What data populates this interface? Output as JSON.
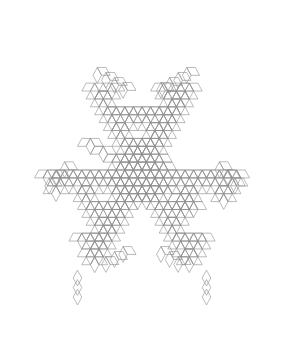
{
  "figure": {
    "title": "Rhombus Fractal Snowflake",
    "type": "geometric-line-drawing",
    "canvas": {
      "width": 284,
      "height": 339,
      "background_color": "#ffffff"
    },
    "stroke": {
      "color": "#8d8d8d",
      "width": 0.6,
      "fill": "none"
    },
    "geometry": {
      "tile_shape": "rhombus",
      "tile_angle_degrees": 60,
      "edge_length": 8.6,
      "symmetry": "6-fold dihedral (D6), vertically elongated",
      "center_x": 142,
      "center_y": 170,
      "aspect_scale_x": 1.0,
      "aspect_scale_y": 1.06,
      "bounds": {
        "left": 18,
        "right": 266,
        "top": 12,
        "bottom": 322
      }
    },
    "construction": {
      "description": "Fractal aggregate of 60-degree rhombi grown on a triangular lattice. Each lattice node within the generator mask emits three rhombi at 0, 60 and 120 degrees.",
      "levels": 3,
      "branch_directions_degrees": [
        0,
        60,
        120,
        180,
        240,
        300
      ],
      "mask_rule": "digit-sum / Sierpinski-style carry test on hex coordinates",
      "core_radius_cells": 7,
      "arm_count": 6,
      "arm_motifs": [
        "butterfly",
        "six-point-star",
        "diamond-chain"
      ]
    },
    "features": {
      "core": "dense rhombille lattice with interlocking six-point stars",
      "upper_spikes": 2,
      "lower_spikes": 2,
      "lateral_arms": 4,
      "diamond_chain_length": 3
    }
  }
}
